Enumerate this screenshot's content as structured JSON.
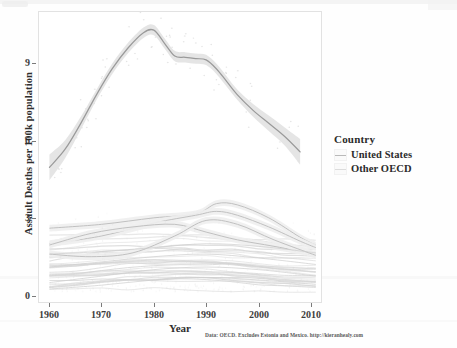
{
  "chart_data": {
    "type": "line",
    "title": "",
    "xlabel": "Year",
    "ylabel": "Assault Deaths per 100k population",
    "xlim": [
      1958,
      2012
    ],
    "ylim": [
      -0.3,
      10.9
    ],
    "xticks": [
      "1960",
      "1970",
      "1980",
      "1990",
      "2000",
      "2010"
    ],
    "xtick_values": [
      1960,
      1970,
      1980,
      1990,
      2000,
      2010
    ],
    "yticks": [
      "0",
      "3",
      "6",
      "9"
    ],
    "ytick_values": [
      0,
      3,
      6,
      9
    ],
    "grid": false,
    "legend_position": "right",
    "legend_title": "Country",
    "caption": "Data: OECD. Excludes Estonia and Mexico. http://kieranhealy.com",
    "series": [
      {
        "name": "United States",
        "color": "#9a9a9a",
        "ribbon_color": "#e4e4e4",
        "x": [
          1960,
          1963,
          1966,
          1969,
          1972,
          1975,
          1978,
          1980,
          1982,
          1984,
          1986,
          1988,
          1990,
          1992,
          1994,
          1996,
          1999,
          2002,
          2005,
          2008
        ],
        "values": [
          4.9,
          5.6,
          6.6,
          7.7,
          8.7,
          9.5,
          10.1,
          10.2,
          9.7,
          9.2,
          9.15,
          9.1,
          9.05,
          8.7,
          8.2,
          7.7,
          7.1,
          6.6,
          6.1,
          5.5
        ],
        "ci_low": [
          4.4,
          5.25,
          6.35,
          7.5,
          8.5,
          9.3,
          9.9,
          10.0,
          9.5,
          9.0,
          8.95,
          8.9,
          8.85,
          8.5,
          8.0,
          7.5,
          6.85,
          6.3,
          5.75,
          5.0
        ],
        "ci_high": [
          5.4,
          5.95,
          6.85,
          7.9,
          8.9,
          9.7,
          10.3,
          10.4,
          9.9,
          9.4,
          9.35,
          9.3,
          9.25,
          8.9,
          8.4,
          7.9,
          7.35,
          6.9,
          6.45,
          6.0
        ]
      },
      {
        "name": "Other OECD",
        "color": "#c9c9c9",
        "ribbon_color": "#eeeeee",
        "band_low": 0.15,
        "band_high": 3.55,
        "n_countries": 30,
        "note": "Dense bundle of ~30 national smooths; most lie between 0.2 and 2.2, two outliers peak near 3.5 around 1992."
      }
    ],
    "series_detail_other_oecd": [
      {
        "name": "outlier-a",
        "x": [
          1960,
          1970,
          1980,
          1988,
          1992,
          1996,
          2002,
          2008,
          2011
        ],
        "values": [
          2.55,
          2.7,
          2.95,
          3.1,
          3.5,
          3.45,
          2.95,
          2.2,
          1.9
        ]
      },
      {
        "name": "outlier-b",
        "x": [
          1960,
          1970,
          1980,
          1988,
          1992,
          1996,
          2002,
          2008,
          2011
        ],
        "values": [
          1.95,
          2.25,
          2.75,
          3.05,
          3.2,
          3.05,
          2.6,
          2.05,
          1.8
        ]
      },
      {
        "name": "outlier-c",
        "x": [
          1960,
          1968,
          1976,
          1984,
          1990,
          1996,
          2003,
          2011
        ],
        "values": [
          1.9,
          2.35,
          2.6,
          2.7,
          2.4,
          2.1,
          1.85,
          1.55
        ]
      },
      {
        "name": "outlier-d",
        "x": [
          1960,
          1968,
          1976,
          1984,
          1990,
          1996,
          2003,
          2011
        ],
        "values": [
          1.55,
          1.45,
          1.6,
          2.25,
          2.85,
          2.7,
          2.1,
          1.5
        ]
      },
      {
        "name": "bundle-upper",
        "x": [
          1960,
          1970,
          1980,
          1990,
          2000,
          2011
        ],
        "values": [
          1.55,
          1.65,
          1.8,
          1.95,
          1.85,
          1.6
        ]
      },
      {
        "name": "bundle-mid",
        "x": [
          1960,
          1970,
          1980,
          1990,
          2000,
          2011
        ],
        "values": [
          1.05,
          1.25,
          1.45,
          1.55,
          1.4,
          1.15
        ]
      },
      {
        "name": "bundle-lower",
        "x": [
          1960,
          1970,
          1980,
          1990,
          2000,
          2011
        ],
        "values": [
          0.45,
          0.7,
          0.95,
          1.05,
          0.95,
          0.7
        ]
      },
      {
        "name": "bundle-floor",
        "x": [
          1960,
          1970,
          1980,
          1990,
          2000,
          2011
        ],
        "values": [
          0.2,
          0.35,
          0.55,
          0.65,
          0.55,
          0.38
        ]
      }
    ]
  },
  "legend": {
    "title": "Country",
    "items": [
      {
        "label": "United States",
        "swatch_color": "#b9b9b9"
      },
      {
        "label": "Other OECD",
        "swatch_color": "#dcdcdc"
      }
    ]
  },
  "axes": {
    "y_title": "Assault Deaths per 100k population",
    "x_title": "Year",
    "y_ticks": [
      "9",
      "6",
      "3",
      "0"
    ],
    "x_ticks": [
      "1960",
      "1970",
      "1980",
      "1990",
      "2000",
      "2010"
    ]
  },
  "footer": {
    "caption": "Data: OECD. Excludes Estonia and Mexico. http://kieranhealy.com"
  }
}
